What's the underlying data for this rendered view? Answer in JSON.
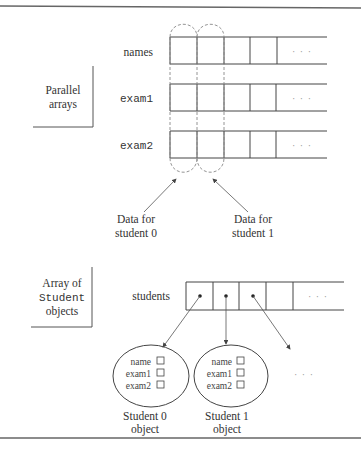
{
  "parallel": {
    "box_label_line1": "Parallel",
    "box_label_line2": "arrays",
    "arrays": [
      {
        "label": "names",
        "font": "serif"
      },
      {
        "label": "exam1",
        "font": "mono"
      },
      {
        "label": "exam2",
        "font": "mono"
      }
    ],
    "ellipsis": "· · ·",
    "callouts": [
      {
        "line1": "Data for",
        "line2": "student 0"
      },
      {
        "line1": "Data for",
        "line2": "student 1"
      }
    ]
  },
  "objects": {
    "box_label_line1": "Array of",
    "box_label_line2": "Student",
    "box_label_line3": "objects",
    "array_label": "students",
    "ellipsis": "· · ·",
    "fields": [
      "name",
      "exam1",
      "exam2"
    ],
    "student_objects": [
      {
        "line1": "Student 0",
        "line2": "object"
      },
      {
        "line1": "Student 1",
        "line2": "object"
      }
    ],
    "more_ellipsis": "· · ·"
  },
  "colors": {
    "line": "#444444",
    "dashed": "#888888",
    "border": "#666666"
  }
}
